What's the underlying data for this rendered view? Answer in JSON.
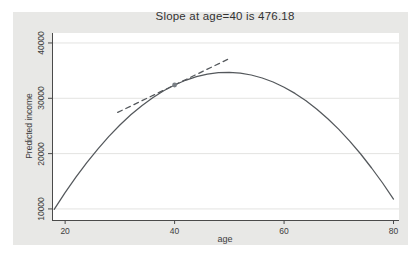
{
  "figure": {
    "region_bg": "#e8e8e6",
    "plot_bg": "#ffffff",
    "axis_color": "#4a4a4a",
    "grid_color": "#e3e3e1",
    "text_color": "#3d3d3d",
    "curve_color": "#54585c",
    "tangent_color": "#54585c",
    "marker_color": "#7a8086"
  },
  "chart_data": {
    "type": "line",
    "title": "Slope at age=40 is 476.18",
    "xlabel": "age",
    "ylabel": "Predicted income",
    "x_ticks": [
      20,
      40,
      60,
      80
    ],
    "y_ticks": [
      10000,
      20000,
      30000,
      40000
    ],
    "xlim": [
      17.6,
      81.0
    ],
    "ylim": [
      8000,
      41800
    ],
    "grid": "horizontal",
    "legend": "none",
    "annotation": {
      "age": 40,
      "slope": 476.18
    },
    "series": [
      {
        "name": "predicted-income-curve",
        "type": "line",
        "style": "solid",
        "x": [
          18,
          20,
          22,
          24,
          26,
          28,
          30,
          32,
          34,
          36,
          38,
          40,
          42,
          44,
          46,
          48,
          50,
          52,
          54,
          56,
          58,
          60,
          62,
          64,
          66,
          68,
          70,
          72,
          74,
          76,
          78,
          80
        ],
        "y": [
          9926,
          12961,
          15798,
          18437,
          20877,
          23119,
          25163,
          27008,
          28655,
          30103,
          31353,
          32404,
          33258,
          33912,
          34369,
          34627,
          34686,
          34547,
          34210,
          33674,
          32940,
          32008,
          30877,
          29547,
          28020,
          26294,
          24369,
          22246,
          19925,
          17405,
          14687,
          11771
        ]
      },
      {
        "name": "tangent-line-at-age-40",
        "type": "line",
        "style": "dashed",
        "x": [
          29.6,
          50
        ],
        "y": [
          27452,
          37166
        ]
      },
      {
        "name": "tangent-point",
        "type": "scatter",
        "x": [
          40
        ],
        "y": [
          32404
        ]
      }
    ]
  }
}
